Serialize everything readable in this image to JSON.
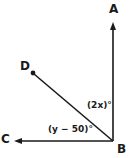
{
  "figure": {
    "type": "geometry-diagram",
    "background_color": "#ffffff",
    "stroke_color": "#1a1a1a",
    "points": [
      {
        "id": "A",
        "label": "A",
        "x": 113,
        "y": 24,
        "endpoint": "arrow"
      },
      {
        "id": "B",
        "label": "B",
        "x": 113,
        "y": 141,
        "endpoint": "vertex"
      },
      {
        "id": "C",
        "label": "C",
        "x": 16,
        "y": 141,
        "endpoint": "arrow"
      },
      {
        "id": "D",
        "label": "D",
        "x": 33,
        "y": 73,
        "endpoint": "dot"
      }
    ],
    "segments": [
      {
        "id": "BA",
        "from": "B",
        "to": "A"
      },
      {
        "id": "BC",
        "from": "B",
        "to": "C"
      },
      {
        "id": "BD",
        "from": "B",
        "to": "D"
      }
    ],
    "angles": [
      {
        "id": "ABD",
        "label": "(2x)°",
        "expression": "2x",
        "between": [
          "BA",
          "BD"
        ]
      },
      {
        "id": "DBC",
        "label": "(y − 50)°",
        "expression": "y − 50",
        "between": [
          "BD",
          "BC"
        ]
      }
    ]
  }
}
